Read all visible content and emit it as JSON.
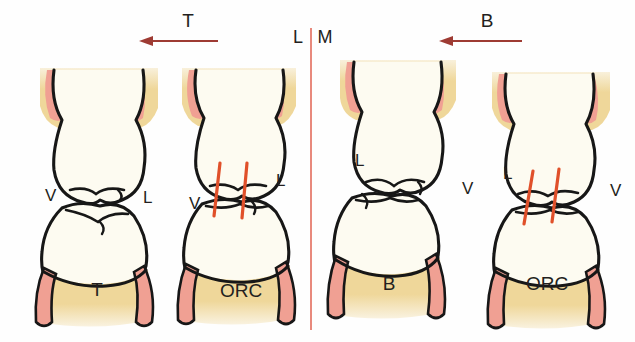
{
  "figure": {
    "background_color": "#fefefe",
    "midline": {
      "name": "midline-divider",
      "color": "#e8897c",
      "x": 311,
      "y_top": 28,
      "y_bottom": 330
    }
  },
  "palette": {
    "outline": "#171717",
    "enamel": "#fdfbf1",
    "bone": "#efd79a",
    "gingiva": "#f0a093",
    "hatch_red": "#e0502a",
    "arrow_red": "#9e3b33",
    "label_dark": "#231f20"
  },
  "arrows": [
    {
      "name": "arrow-t",
      "label": "T",
      "label_x": 188,
      "label_y": 27,
      "direction": "left",
      "x_start": 218,
      "x_end": 140,
      "y": 41,
      "color": "#9e3b33"
    },
    {
      "name": "arrow-b",
      "label": "B",
      "label_x": 487,
      "label_y": 27,
      "direction": "left",
      "x_start": 522,
      "x_end": 440,
      "y": 41,
      "color": "#9e3b33"
    }
  ],
  "midline_labels": [
    {
      "name": "midline-label-lingual",
      "text": "L",
      "x": 298,
      "y": 43
    },
    {
      "name": "midline-label-mesial",
      "text": "M",
      "x": 325,
      "y": 43
    }
  ],
  "tooth_groups": [
    {
      "name": "group-left",
      "side": "left",
      "arrow": "T",
      "units": [
        {
          "name": "tooth-unit-t",
          "code": "T",
          "code_x": 97,
          "code_y": 296,
          "has_hatch": false,
          "side_labels": [
            {
              "name": "label-vestibular",
              "text": "V",
              "x": 45,
              "y": 201
            },
            {
              "name": "label-lingual",
              "text": "L",
              "x": 143,
              "y": 203
            }
          ]
        },
        {
          "name": "tooth-unit-orc-left",
          "code": "ORC",
          "code_x": 241,
          "code_y": 297,
          "has_hatch": true,
          "hatch_marks": [
            {
              "name": "hatch-mark-1",
              "x_top": 220,
              "y_top": 163,
              "x_bottom": 214,
              "y_bottom": 216
            },
            {
              "name": "hatch-mark-2",
              "x_top": 247,
              "y_top": 163,
              "x_bottom": 242,
              "y_bottom": 218
            }
          ],
          "side_labels": [
            {
              "name": "label-vestibular",
              "text": "V",
              "x": 189,
              "y": 209
            },
            {
              "name": "label-lingual",
              "text": "L",
              "x": 276,
              "y": 186
            }
          ]
        }
      ]
    },
    {
      "name": "group-right",
      "side": "right",
      "arrow": "B",
      "units": [
        {
          "name": "tooth-unit-b",
          "code": "B",
          "code_x": 389,
          "code_y": 290,
          "has_hatch": false,
          "side_labels": [
            {
              "name": "label-lingual",
              "text": "L",
              "x": 355,
              "y": 166
            },
            {
              "name": "label-vestibular",
              "text": "V",
              "x": 462,
              "y": 194
            }
          ]
        },
        {
          "name": "tooth-unit-orc-right",
          "code": "ORC",
          "code_x": 547,
          "code_y": 290,
          "has_hatch": true,
          "hatch_marks": [
            {
              "name": "hatch-mark-1",
              "x_top": 533,
              "y_top": 171,
              "x_bottom": 524,
              "y_bottom": 224
            },
            {
              "name": "hatch-mark-2",
              "x_top": 559,
              "y_top": 169,
              "x_bottom": 552,
              "y_bottom": 222
            }
          ],
          "side_labels": [
            {
              "name": "label-lingual",
              "text": "L",
              "x": 503,
              "y": 179
            },
            {
              "name": "label-vestibular",
              "text": "V",
              "x": 610,
              "y": 196
            }
          ]
        }
      ]
    }
  ]
}
